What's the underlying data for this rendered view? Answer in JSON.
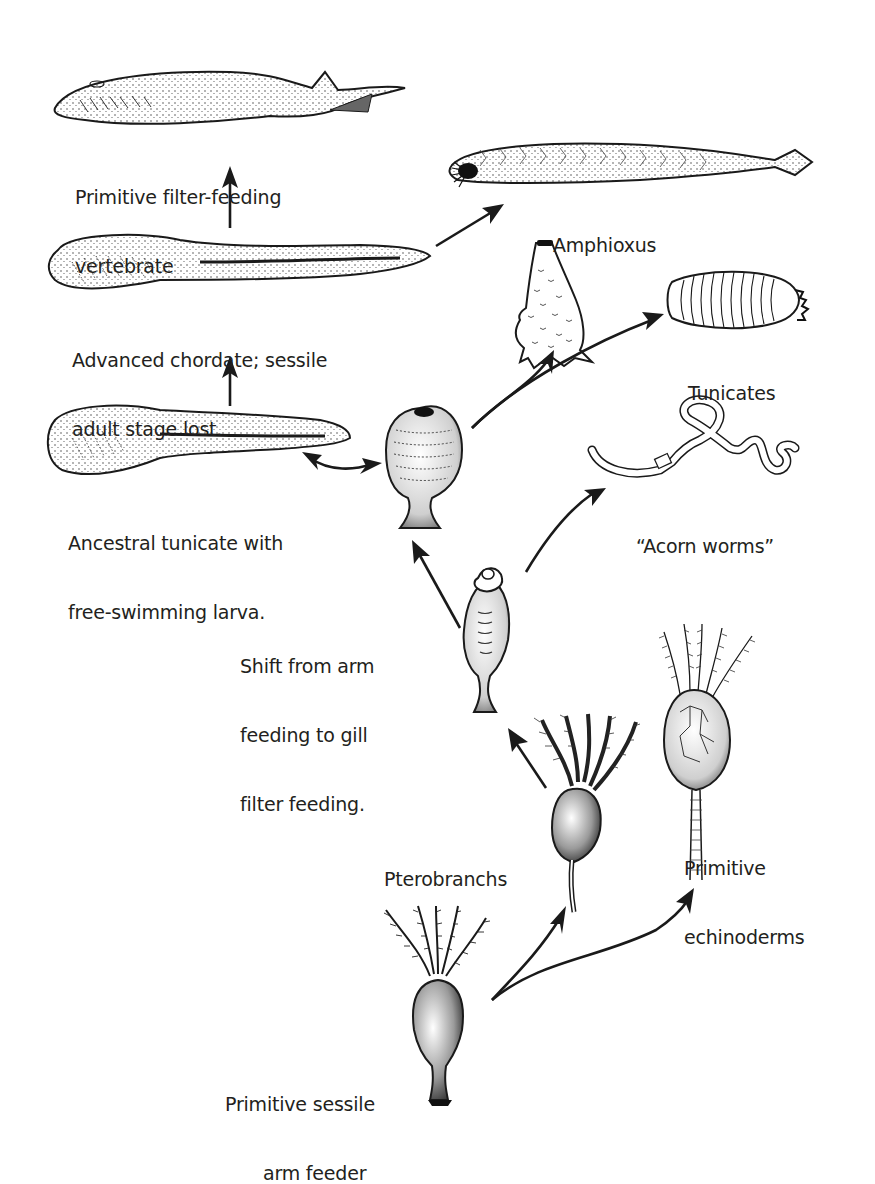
{
  "figure": {
    "type": "evolutionary-diagram",
    "background": "#ffffff",
    "ink_color": "#1a1a1a"
  },
  "organisms": [
    {
      "id": "primitive-vertebrate",
      "label_lines": [
        "Primitive filter-feeding",
        "vertebrate"
      ]
    },
    {
      "id": "amphioxus",
      "label_lines": [
        "Amphioxus"
      ]
    },
    {
      "id": "advanced-chordate",
      "label_lines": [
        "Advanced chordate; sessile",
        "adult stage lost."
      ]
    },
    {
      "id": "tunicates",
      "label_lines": [
        "Tunicates"
      ]
    },
    {
      "id": "ancestral-tunicate",
      "label_lines": [
        "Ancestral tunicate with",
        "free-swimming larva."
      ]
    },
    {
      "id": "acorn-worms",
      "label_lines": [
        "“Acorn worms”"
      ]
    },
    {
      "id": "gill-filter-feeder",
      "label_lines": [
        "Shift from arm",
        "feeding to gill",
        "filter feeding."
      ]
    },
    {
      "id": "pterobranchs",
      "label_lines": [
        "Pterobranchs"
      ]
    },
    {
      "id": "primitive-echinoderms",
      "label_lines": [
        "Primitive",
        "echinoderms"
      ]
    },
    {
      "id": "sessile-arm-feeder",
      "label_lines": [
        "Primitive sessile",
        "arm feeder"
      ]
    }
  ],
  "edges": [
    {
      "from": "sessile-arm-feeder",
      "to": "pterobranchs"
    },
    {
      "from": "sessile-arm-feeder",
      "to": "primitive-echinoderms"
    },
    {
      "from": "pterobranchs",
      "to": "gill-filter-feeder"
    },
    {
      "from": "gill-filter-feeder",
      "to": "ancestral-tunicate"
    },
    {
      "from": "gill-filter-feeder",
      "to": "acorn-worms"
    },
    {
      "from": "ancestral-tunicate",
      "to": "tunicates"
    },
    {
      "from": "ancestral-tunicate",
      "to": "tunicates-colonial"
    },
    {
      "from": "ancestral-tunicate",
      "to": "ancestral-tunicate-larva",
      "bidirectional": true
    },
    {
      "from": "ancestral-tunicate-larva",
      "to": "advanced-chordate"
    },
    {
      "from": "advanced-chordate",
      "to": "primitive-vertebrate"
    },
    {
      "from": "advanced-chordate",
      "to": "amphioxus"
    }
  ]
}
